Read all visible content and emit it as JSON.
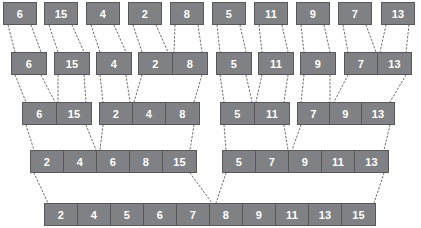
{
  "diagram": {
    "type": "merge-sort-visualization",
    "box_fill_color": "#808184",
    "box_border_color": "#58585a",
    "text_color": "#ffffff",
    "connector_color": "#6d6e71",
    "connector_style": "dashed",
    "background_color": "#ffffff"
  },
  "levels": [
    {
      "index": 0,
      "name": "fully-split",
      "y": 2,
      "blocks": [
        {
          "x": 3,
          "cell_width": 32,
          "values": [
            6
          ]
        },
        {
          "x": 44,
          "cell_width": 32,
          "values": [
            15
          ]
        },
        {
          "x": 86,
          "cell_width": 32,
          "values": [
            4
          ]
        },
        {
          "x": 128,
          "cell_width": 32,
          "values": [
            2
          ]
        },
        {
          "x": 170,
          "cell_width": 32,
          "values": [
            8
          ]
        },
        {
          "x": 212,
          "cell_width": 32,
          "values": [
            5
          ]
        },
        {
          "x": 254,
          "cell_width": 32,
          "values": [
            11
          ]
        },
        {
          "x": 296,
          "cell_width": 32,
          "values": [
            9
          ]
        },
        {
          "x": 338,
          "cell_width": 32,
          "values": [
            7
          ]
        },
        {
          "x": 381,
          "cell_width": 32,
          "values": [
            13
          ]
        }
      ]
    },
    {
      "index": 1,
      "name": "merge-pass-1",
      "y": 52,
      "blocks": [
        {
          "x": 11,
          "cell_width": 34,
          "values": [
            6
          ]
        },
        {
          "x": 54,
          "cell_width": 34,
          "values": [
            15
          ]
        },
        {
          "x": 96,
          "cell_width": 34,
          "values": [
            4
          ]
        },
        {
          "x": 138,
          "cell_width": 34,
          "values": [
            2,
            8
          ]
        },
        {
          "x": 216,
          "cell_width": 34,
          "values": [
            5
          ]
        },
        {
          "x": 258,
          "cell_width": 34,
          "values": [
            11
          ]
        },
        {
          "x": 300,
          "cell_width": 34,
          "values": [
            9
          ]
        },
        {
          "x": 344,
          "cell_width": 33,
          "values": [
            7,
            13
          ]
        }
      ]
    },
    {
      "index": 2,
      "name": "merge-pass-2",
      "y": 102,
      "blocks": [
        {
          "x": 22,
          "cell_width": 34,
          "values": [
            6,
            15
          ]
        },
        {
          "x": 99,
          "cell_width": 33,
          "values": [
            2,
            4,
            8
          ]
        },
        {
          "x": 220,
          "cell_width": 34,
          "values": [
            5,
            11
          ]
        },
        {
          "x": 297,
          "cell_width": 32,
          "values": [
            7,
            9,
            13
          ]
        }
      ]
    },
    {
      "index": 3,
      "name": "merge-pass-3",
      "y": 150,
      "blocks": [
        {
          "x": 30,
          "cell_width": 33,
          "values": [
            2,
            4,
            6,
            8,
            15
          ]
        },
        {
          "x": 222,
          "cell_width": 33,
          "values": [
            5,
            7,
            9,
            11,
            13
          ]
        }
      ]
    },
    {
      "index": 4,
      "name": "final-sorted",
      "y": 203,
      "blocks": [
        {
          "x": 44,
          "cell_width": 33,
          "values": [
            2,
            4,
            5,
            6,
            7,
            8,
            9,
            11,
            13,
            15
          ]
        }
      ]
    }
  ],
  "connectors": [
    {
      "from": [
        8,
        25
      ],
      "to": [
        15,
        52
      ]
    },
    {
      "from": [
        31,
        25
      ],
      "to": [
        41,
        52
      ]
    },
    {
      "from": [
        49,
        25
      ],
      "to": [
        58,
        52
      ]
    },
    {
      "from": [
        72,
        25
      ],
      "to": [
        84,
        52
      ]
    },
    {
      "from": [
        91,
        25
      ],
      "to": [
        100,
        52
      ]
    },
    {
      "from": [
        114,
        25
      ],
      "to": [
        126,
        52
      ]
    },
    {
      "from": [
        133,
        25
      ],
      "to": [
        142,
        52
      ]
    },
    {
      "from": [
        156,
        25
      ],
      "to": [
        168,
        52
      ]
    },
    {
      "from": [
        175,
        25
      ],
      "to": [
        174,
        52
      ]
    },
    {
      "from": [
        198,
        25
      ],
      "to": [
        202,
        52
      ]
    },
    {
      "from": [
        217,
        25
      ],
      "to": [
        220,
        52
      ]
    },
    {
      "from": [
        240,
        25
      ],
      "to": [
        246,
        52
      ]
    },
    {
      "from": [
        259,
        25
      ],
      "to": [
        262,
        52
      ]
    },
    {
      "from": [
        282,
        25
      ],
      "to": [
        288,
        52
      ]
    },
    {
      "from": [
        301,
        25
      ],
      "to": [
        304,
        52
      ]
    },
    {
      "from": [
        324,
        25
      ],
      "to": [
        330,
        52
      ]
    },
    {
      "from": [
        343,
        25
      ],
      "to": [
        348,
        52
      ]
    },
    {
      "from": [
        366,
        25
      ],
      "to": [
        376,
        52
      ]
    },
    {
      "from": [
        386,
        25
      ],
      "to": [
        380,
        52
      ]
    },
    {
      "from": [
        409,
        25
      ],
      "to": [
        406,
        52
      ]
    },
    {
      "from": [
        15,
        75
      ],
      "to": [
        26,
        102
      ]
    },
    {
      "from": [
        41,
        75
      ],
      "to": [
        55,
        102
      ]
    },
    {
      "from": [
        58,
        75
      ],
      "to": [
        58,
        102
      ]
    },
    {
      "from": [
        84,
        75
      ],
      "to": [
        86,
        102
      ]
    },
    {
      "from": [
        100,
        75
      ],
      "to": [
        103,
        102
      ]
    },
    {
      "from": [
        126,
        75
      ],
      "to": [
        130,
        102
      ]
    },
    {
      "from": [
        142,
        75
      ],
      "to": [
        134,
        102
      ]
    },
    {
      "from": [
        202,
        75
      ],
      "to": [
        194,
        102
      ]
    },
    {
      "from": [
        220,
        75
      ],
      "to": [
        224,
        102
      ]
    },
    {
      "from": [
        246,
        75
      ],
      "to": [
        252,
        102
      ]
    },
    {
      "from": [
        262,
        75
      ],
      "to": [
        256,
        102
      ]
    },
    {
      "from": [
        288,
        75
      ],
      "to": [
        284,
        102
      ]
    },
    {
      "from": [
        304,
        75
      ],
      "to": [
        301,
        102
      ]
    },
    {
      "from": [
        330,
        75
      ],
      "to": [
        330,
        102
      ]
    },
    {
      "from": [
        348,
        75
      ],
      "to": [
        334,
        102
      ]
    },
    {
      "from": [
        406,
        75
      ],
      "to": [
        390,
        102
      ]
    },
    {
      "from": [
        26,
        125
      ],
      "to": [
        34,
        150
      ]
    },
    {
      "from": [
        86,
        125
      ],
      "to": [
        96,
        150
      ]
    },
    {
      "from": [
        103,
        125
      ],
      "to": [
        100,
        150
      ]
    },
    {
      "from": [
        194,
        125
      ],
      "to": [
        190,
        150
      ]
    },
    {
      "from": [
        224,
        125
      ],
      "to": [
        226,
        150
      ]
    },
    {
      "from": [
        284,
        125
      ],
      "to": [
        288,
        150
      ]
    },
    {
      "from": [
        301,
        125
      ],
      "to": [
        292,
        150
      ]
    },
    {
      "from": [
        390,
        125
      ],
      "to": [
        384,
        150
      ]
    },
    {
      "from": [
        34,
        173
      ],
      "to": [
        48,
        203
      ]
    },
    {
      "from": [
        190,
        173
      ],
      "to": [
        212,
        203
      ]
    },
    {
      "from": [
        226,
        173
      ],
      "to": [
        216,
        203
      ]
    },
    {
      "from": [
        384,
        173
      ],
      "to": [
        374,
        203
      ]
    }
  ]
}
